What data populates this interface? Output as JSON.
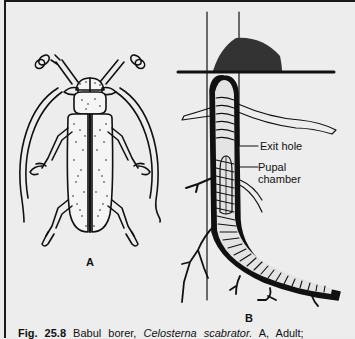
{
  "figure": {
    "panels": [
      {
        "id": "A",
        "letter": "A",
        "subject": "adult beetle (dorsal view)"
      },
      {
        "id": "B",
        "letter": "B",
        "subject": "larval tunnel in root"
      }
    ],
    "annotations": {
      "exit_hole": "Exit hole",
      "pupal_chamber_line1": "Pupal",
      "pupal_chamber_line2": "chamber"
    },
    "caption": {
      "fig_number": "Fig. 25.8",
      "common_name": "Babul borer,",
      "scientific_name": "Celosterna scabrator.",
      "rest": "A, Adult;"
    }
  },
  "colors": {
    "background": "#ececec",
    "ink": "#111111"
  }
}
